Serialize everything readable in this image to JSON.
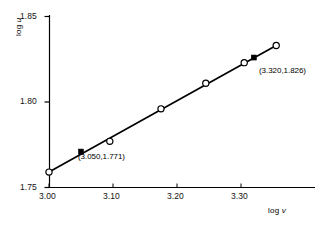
{
  "chart_data": {
    "type": "scatter",
    "title": "",
    "subtitle": "",
    "xlabel": "log v",
    "ylabel": "log u",
    "xlabel_prefix": "log ",
    "xlabel_var": "v",
    "ylabel_prefix": "log ",
    "ylabel_var": "u",
    "xlim": [
      2.985,
      3.375
    ],
    "ylim": [
      1.7465,
      1.852
    ],
    "xticks": [
      3.0,
      3.1,
      3.2,
      3.3
    ],
    "xticklabels": [
      "3.00",
      "3.10",
      "3.20",
      "3.30"
    ],
    "yticks": [
      1.75,
      1.8,
      1.85
    ],
    "yticklabels": [
      "1.75",
      "1.80",
      "1.85"
    ],
    "grid": false,
    "legend": "none",
    "x": [
      3.0,
      3.095,
      3.175,
      3.245,
      3.305,
      3.355
    ],
    "y": [
      1.759,
      1.777,
      1.796,
      1.811,
      1.823,
      1.833
    ],
    "series": [
      {
        "name": "open-circle data points",
        "marker": "open-circle",
        "x": [
          3.0,
          3.095,
          3.175,
          3.245,
          3.305,
          3.355
        ],
        "values": [
          1.759,
          1.777,
          1.796,
          1.811,
          1.823,
          1.833
        ]
      },
      {
        "name": "highlighted points",
        "marker": "filled-square",
        "x": [
          3.05,
          3.32
        ],
        "values": [
          1.771,
          1.826
        ]
      }
    ],
    "fit_line": {
      "from": [
        3.0,
        1.759
      ],
      "to": [
        3.355,
        1.833
      ]
    },
    "annotations": [
      {
        "id": "point-a",
        "text": "(3.050,1.771)",
        "point": [
          3.05,
          1.771
        ],
        "label_x": 3.068,
        "label_y": 1.7645
      },
      {
        "id": "point-b",
        "text": "(3.320,1.826)",
        "point": [
          3.32,
          1.826
        ],
        "label_x": 3.322,
        "label_y": 1.8198
      }
    ],
    "colors": {
      "line": "#000000",
      "axis": "#000000",
      "marker_face": "#ffffff",
      "marker_edge": "#000000",
      "highlight": "#000000",
      "background": "#ffffff"
    }
  }
}
